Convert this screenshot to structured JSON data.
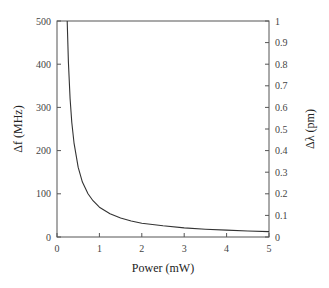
{
  "chart_data": {
    "type": "line",
    "title": "",
    "xlabel": "Power (mW)",
    "ylabel": "Δf (MHz)",
    "ylabel_right": "Δλ (pm)",
    "xlim": [
      0,
      5
    ],
    "ylim": [
      0,
      500
    ],
    "ylim_right": [
      0,
      1
    ],
    "x_ticks": [
      "0",
      "1",
      "2",
      "3",
      "4",
      "5"
    ],
    "y_ticks": [
      "0",
      "100",
      "200",
      "300",
      "400",
      "500"
    ],
    "y_ticks_right": [
      "0",
      "0.1",
      "0.2",
      "0.3",
      "0.4",
      "0.5",
      "0.6",
      "0.7",
      "0.8",
      "0.9",
      "1"
    ],
    "grid": false,
    "legend": null,
    "series": [
      {
        "name": "Δf vs Power",
        "x": [
          0.24,
          0.27,
          0.31,
          0.35,
          0.4,
          0.5,
          0.6,
          0.73,
          0.85,
          1.0,
          1.25,
          1.5,
          1.75,
          2.0,
          2.5,
          3.0,
          3.5,
          4.0,
          4.5,
          5.0
        ],
        "values": [
          500,
          405,
          320,
          265,
          218,
          161,
          127,
          100,
          84,
          69,
          54,
          44,
          37,
          32,
          26,
          21,
          18,
          16,
          14,
          12.5
        ]
      }
    ]
  }
}
